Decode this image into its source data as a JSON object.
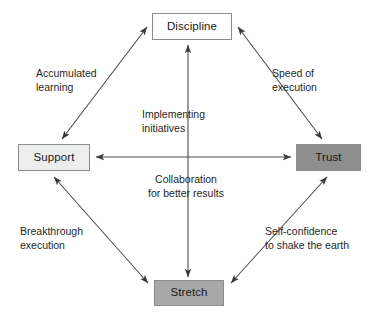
{
  "diagram": {
    "nodes": [
      {
        "id": "discipline",
        "label": "Discipline",
        "fill": "#ffffff",
        "border": "#8c8c8c"
      },
      {
        "id": "support",
        "label": "Support",
        "fill": "#eceded",
        "border": "#8c8c8c"
      },
      {
        "id": "trust",
        "label": "Trust",
        "fill": "#8e8e8e",
        "border": "#8c8c8c"
      },
      {
        "id": "stretch",
        "label": "Stretch",
        "fill": "#a8a8a8",
        "border": "#8c8c8c"
      }
    ],
    "edges": [
      {
        "id": "support-discipline",
        "from": "Support",
        "to": "Discipline",
        "arrows": "both",
        "style": "diagonal",
        "label_line1": "Accumulated",
        "label_line2": "learning"
      },
      {
        "id": "discipline-trust",
        "from": "Discipline",
        "to": "Trust",
        "arrows": "both",
        "style": "diagonal",
        "label_line1": "Speed of",
        "label_line2": "execution"
      },
      {
        "id": "support-stretch",
        "from": "Support",
        "to": "Stretch",
        "arrows": "both",
        "style": "diagonal",
        "label_line1": "Breakthrough",
        "label_line2": "execution"
      },
      {
        "id": "stretch-trust",
        "from": "Stretch",
        "to": "Trust",
        "arrows": "both",
        "style": "diagonal",
        "label_line1": "Self-confidence",
        "label_line2": "to shake the earth"
      },
      {
        "id": "discipline-stretch",
        "from": "Discipline",
        "to": "Stretch",
        "arrows": "both",
        "style": "vertical",
        "label_line1": "Implementing",
        "label_line2": "initiatives"
      },
      {
        "id": "support-trust",
        "from": "Support",
        "to": "Trust",
        "arrows": "both",
        "style": "horizontal",
        "label_line1": "Collaboration",
        "label_line2": "for better results"
      }
    ],
    "colors": {
      "line": "#4d4d4d",
      "text": "#1f1f1f",
      "background": "#ffffff"
    }
  }
}
